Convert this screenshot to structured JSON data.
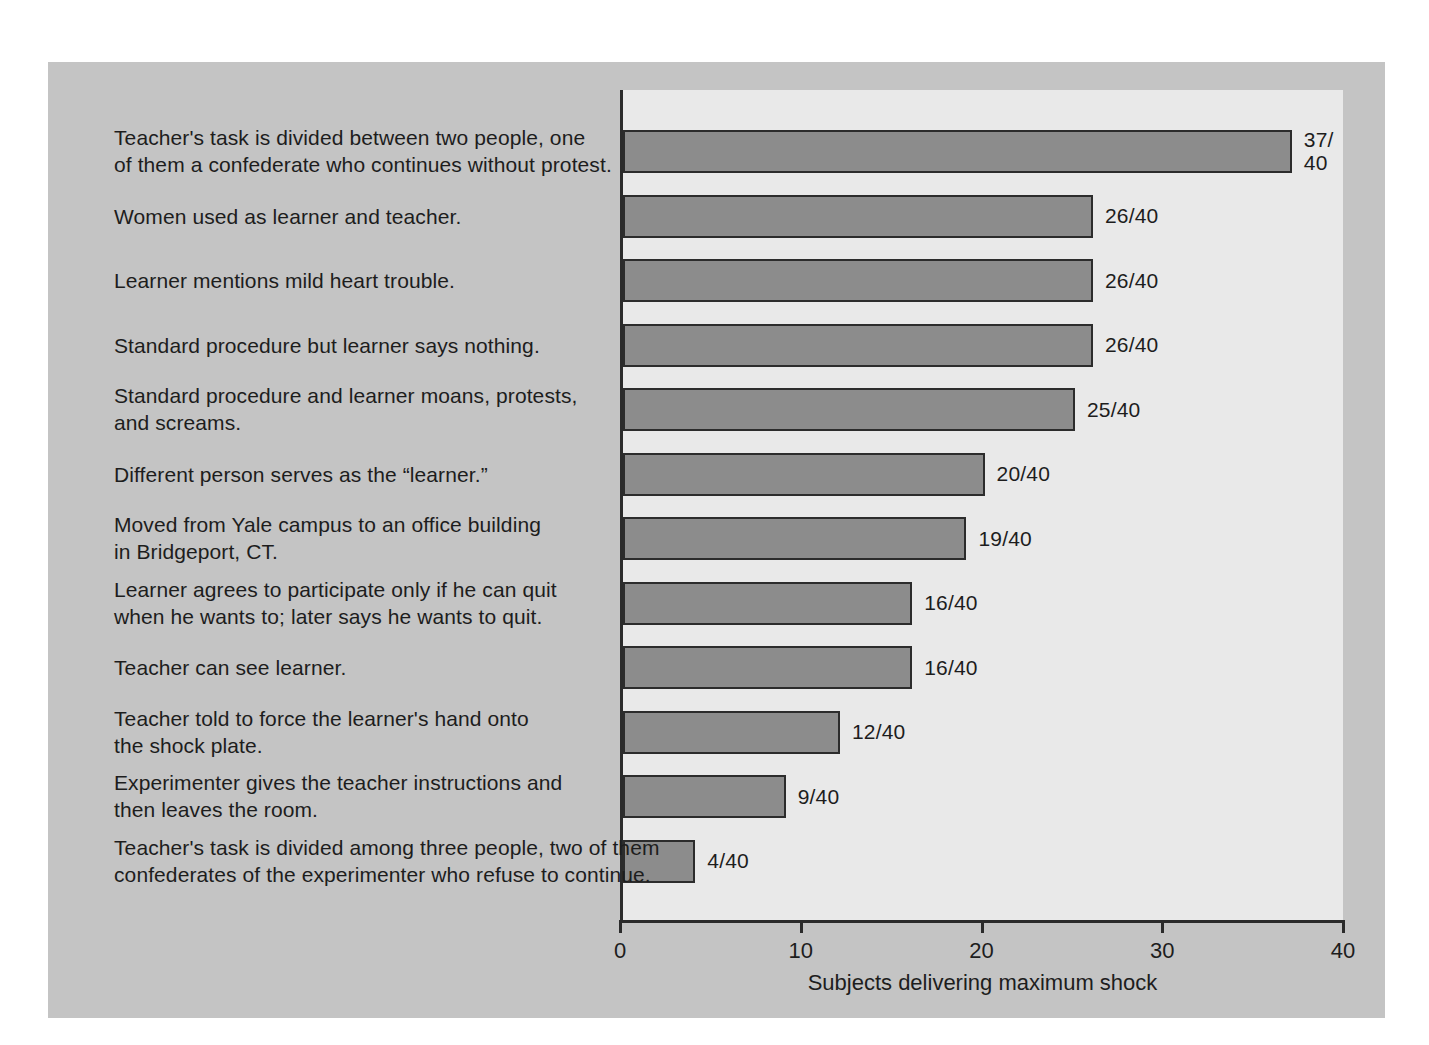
{
  "chart_data": {
    "type": "bar",
    "orientation": "horizontal",
    "title": "",
    "xlabel": "Subjects delivering maximum shock",
    "ylabel": "",
    "xlim": [
      0,
      40
    ],
    "xticks": [
      "0",
      "10",
      "20",
      "30",
      "40"
    ],
    "grid": false,
    "legend": false,
    "denominator": 40,
    "colors": {
      "bar_fill": "#8c8c8c",
      "bar_stroke": "#2c2c2c",
      "plot_background": "#e9e9e9",
      "card_background": "#c4c4c4",
      "page_background": "#ffffff",
      "text": "#1d1d1d",
      "axis": "#2b2b2b"
    },
    "categories": [
      "Teacher's task is divided between two people, one of them a confederate who continues without protest.",
      "Women used as learner and teacher.",
      "Learner mentions mild heart trouble.",
      "Standard procedure but learner says nothing.",
      "Standard procedure and learner moans, protests, and screams.",
      "Different person serves as the “learner.”",
      "Moved from Yale campus to an office building in Bridgeport, CT.",
      "Learner agrees to participate only if he can quit when he wants to; later says he wants to quit.",
      "Teacher can see learner.",
      "Teacher told to force the learner's hand onto the shock plate.",
      "Experimenter gives the teacher instructions and then leaves the room.",
      "Teacher's task is divided among three people, two of them confederates of the experimenter who refuse to continue."
    ],
    "values": [
      37,
      26,
      26,
      26,
      25,
      20,
      19,
      16,
      16,
      12,
      9,
      4
    ],
    "value_labels": [
      "37/\n40",
      "26/40",
      "26/40",
      "26/40",
      "25/40",
      "20/40",
      "19/40",
      "16/40",
      "16/40",
      "12/40",
      "9/40",
      "4/40"
    ]
  },
  "rows": [
    {
      "label_lines": "Teacher's task is divided between two people, one\nof them a confederate who continues without protest.",
      "value": 37,
      "value_label": "37/\n40",
      "wrap_value": true
    },
    {
      "label_lines": "Women used as learner and teacher.",
      "value": 26,
      "value_label": "26/40",
      "wrap_value": false
    },
    {
      "label_lines": "Learner mentions mild heart trouble.",
      "value": 26,
      "value_label": "26/40",
      "wrap_value": false
    },
    {
      "label_lines": "Standard procedure but learner says nothing.",
      "value": 26,
      "value_label": "26/40",
      "wrap_value": false
    },
    {
      "label_lines": "Standard procedure and learner moans, protests,\nand screams.",
      "value": 25,
      "value_label": "25/40",
      "wrap_value": false
    },
    {
      "label_lines": "Different person serves as the “learner.”",
      "value": 20,
      "value_label": "20/40",
      "wrap_value": false
    },
    {
      "label_lines": "Moved from Yale campus to an office building\nin Bridgeport, CT.",
      "value": 19,
      "value_label": "19/40",
      "wrap_value": false
    },
    {
      "label_lines": "Learner agrees to participate only if he can quit\nwhen he wants to; later says he wants to quit.",
      "value": 16,
      "value_label": "16/40",
      "wrap_value": false
    },
    {
      "label_lines": "Teacher can see learner.",
      "value": 16,
      "value_label": "16/40",
      "wrap_value": false
    },
    {
      "label_lines": "Teacher told to force the learner's hand onto\nthe shock plate.",
      "value": 12,
      "value_label": "12/40",
      "wrap_value": false
    },
    {
      "label_lines": "Experimenter gives the teacher instructions and\nthen leaves the room.",
      "value": 9,
      "value_label": "9/40",
      "wrap_value": false
    },
    {
      "label_lines": "Teacher's task is divided among three people, two of them\nconfederates of the experimenter who refuse to continue.",
      "value": 4,
      "value_label": "4/40",
      "wrap_value": false
    }
  ],
  "axis": {
    "ticks": [
      "0",
      "10",
      "20",
      "30",
      "40"
    ],
    "tick_values": [
      0,
      10,
      20,
      30,
      40
    ],
    "title": "Subjects delivering maximum shock"
  }
}
